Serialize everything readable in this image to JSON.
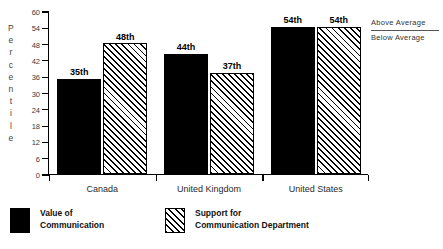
{
  "chart_data": {
    "type": "bar",
    "title": "",
    "xlabel": "",
    "ylabel": "Percentile",
    "ylabel_letters": [
      "P",
      "e",
      "r",
      "c",
      "e",
      "n",
      "t",
      "i",
      "l",
      "e"
    ],
    "categories": [
      "Canada",
      "United Kingdom",
      "United States"
    ],
    "ylim": [
      0,
      60
    ],
    "yticks": [
      0,
      6,
      12,
      18,
      24,
      30,
      36,
      42,
      48,
      54,
      60
    ],
    "grid": false,
    "legend_position": "bottom",
    "series": [
      {
        "name": "Value of Communication",
        "name_lines": [
          "Value of",
          "Communication"
        ],
        "fill": "solid-black",
        "values": [
          35,
          44,
          54
        ],
        "labels": [
          "35th",
          "44th",
          "54th"
        ]
      },
      {
        "name": "Support for Communication Department",
        "name_lines": [
          "Support for",
          "Communication Department"
        ],
        "fill": "diagonal-hatch",
        "values": [
          48,
          37,
          54
        ],
        "labels": [
          "48th",
          "37th",
          "54th"
        ]
      }
    ],
    "annotations": {
      "above": "Above  Average",
      "below": "Below  Average"
    }
  },
  "colors": {
    "ink": "#000000",
    "background": "#ffffff",
    "axis": "#000000",
    "annotation_text": "#333333"
  }
}
